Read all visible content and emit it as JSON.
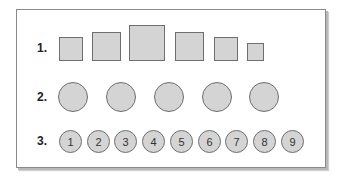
{
  "diagram": {
    "rows": [
      {
        "label": "1.",
        "shape": "square",
        "items": [
          {
            "size": 23
          },
          {
            "size": 29
          },
          {
            "size": 36
          },
          {
            "size": 28
          },
          {
            "size": 23
          },
          {
            "size": 17
          }
        ]
      },
      {
        "label": "2.",
        "shape": "circle",
        "items": [
          {
            "size": 30
          },
          {
            "size": 30
          },
          {
            "size": 30
          },
          {
            "size": 30
          },
          {
            "size": 30
          }
        ]
      },
      {
        "label": "3.",
        "shape": "numbered-circle",
        "items": [
          {
            "text": "1"
          },
          {
            "text": "2"
          },
          {
            "text": "3"
          },
          {
            "text": "4"
          },
          {
            "text": "5"
          },
          {
            "text": "6"
          },
          {
            "text": "7"
          },
          {
            "text": "8"
          },
          {
            "text": "9"
          }
        ]
      }
    ],
    "colors": {
      "fill": "#d4d4d4",
      "stroke": "#6e6e6e",
      "frame_border": "#8a8a8a"
    }
  }
}
